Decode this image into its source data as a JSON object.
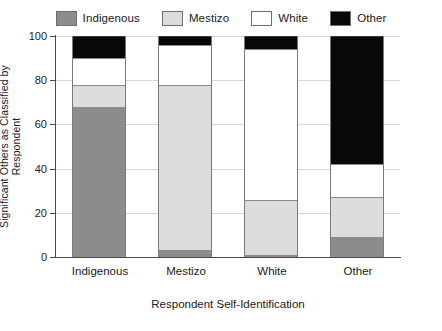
{
  "chart_data": {
    "type": "bar",
    "subtype": "stacked-percentage",
    "title": "",
    "xlabel": "Respondent Self-Identification",
    "ylabel": "Significant Others as Classified by Respondent",
    "categories": [
      "Indigenous",
      "Mestizo",
      "White",
      "Other"
    ],
    "series": [
      {
        "name": "Indigenous",
        "color": "#8c8c8c",
        "values": [
          68,
          3,
          1,
          9
        ]
      },
      {
        "name": "Mestizo",
        "color": "#dcdcdc",
        "values": [
          10,
          75,
          25,
          18
        ]
      },
      {
        "name": "White",
        "color": "#ffffff",
        "values": [
          12,
          18,
          68,
          15
        ]
      },
      {
        "name": "Other",
        "color": "#080808",
        "values": [
          10,
          4,
          6,
          58
        ]
      }
    ],
    "ylim": [
      0,
      100
    ],
    "yticks": [
      0,
      20,
      40,
      60,
      80,
      100
    ],
    "grid": true,
    "legend_position": "top"
  },
  "legend": {
    "items": [
      {
        "label": "Indigenous",
        "swatch": "#8c8c8c"
      },
      {
        "label": "Mestizo",
        "swatch": "#dcdcdc"
      },
      {
        "label": "White",
        "swatch": "#ffffff"
      },
      {
        "label": "Other",
        "swatch": "#080808"
      }
    ]
  },
  "axes": {
    "y_tick_labels": [
      "0",
      "20",
      "40",
      "60",
      "80",
      "100"
    ],
    "x_tick_labels": [
      "Indigenous",
      "Mestizo",
      "White",
      "Other"
    ],
    "y_title": "Significant Others as Classified by Respondent",
    "x_title": "Respondent Self-Identification"
  }
}
